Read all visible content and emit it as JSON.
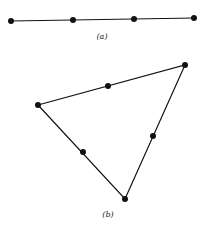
{
  "figure_a": {
    "label": "(a)",
    "points": [
      [
        11,
        21
      ],
      [
        73,
        20
      ],
      [
        134,
        19
      ],
      [
        194,
        18
      ]
    ]
  },
  "figure_b": {
    "label": "(b)",
    "vertices": [
      [
        38,
        105
      ],
      [
        185,
        65
      ],
      [
        125,
        199
      ]
    ],
    "midpoints": [
      [
        108,
        86
      ],
      [
        153,
        136
      ],
      [
        83,
        152
      ]
    ]
  },
  "colors": {
    "stroke": "#111111",
    "background": "#ffffff"
  }
}
